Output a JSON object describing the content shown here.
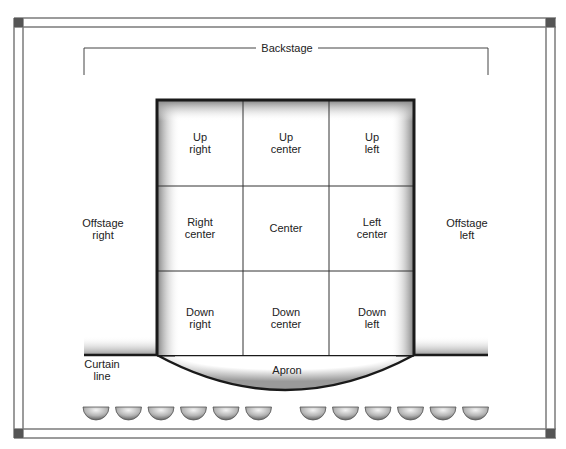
{
  "diagram": {
    "backstage": "Backstage",
    "offstage_right": [
      "Offstage",
      "right"
    ],
    "offstage_left": [
      "Offstage",
      "left"
    ],
    "curtain_line": [
      "Curtain",
      "line"
    ],
    "apron": "Apron",
    "grid": [
      [
        [
          "Up",
          "right"
        ],
        [
          "Up",
          "center"
        ],
        [
          "Up",
          "left"
        ]
      ],
      [
        [
          "Right",
          "center"
        ],
        [
          "Center"
        ],
        [
          "Left",
          "center"
        ]
      ],
      [
        [
          "Down",
          "right"
        ],
        [
          "Down",
          "center"
        ],
        [
          "Down",
          "left"
        ]
      ]
    ],
    "footlights_count": 12,
    "colors": {
      "frame": "#7a7a7a",
      "corner": "#555555",
      "stage_border": "#1a1a1a",
      "grid_line": "#333333",
      "light_dark": "#6e6e6e",
      "light_light": "#e8e8e8"
    }
  }
}
